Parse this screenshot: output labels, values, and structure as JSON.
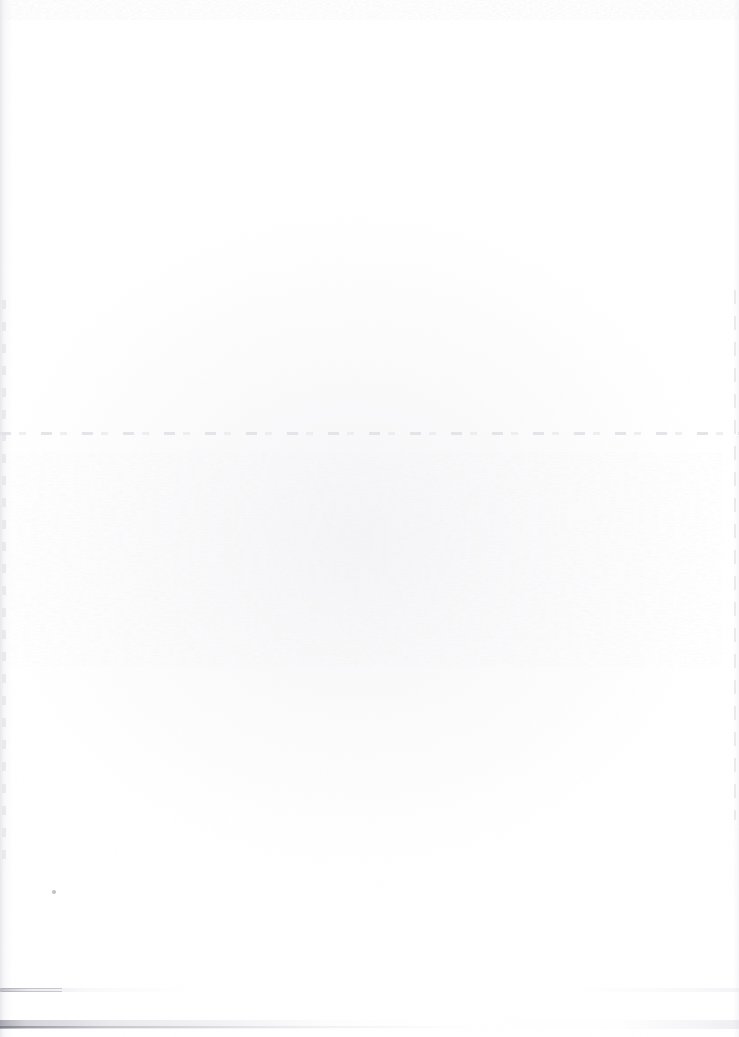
{
  "page": {
    "kind": "scanned-document-page",
    "width_px": 739,
    "height_px": 1037,
    "background_color": "#ffffff",
    "text_content": "",
    "legible_elements_count": 0
  },
  "artifacts": {
    "top_edge_band": {
      "name": "top edge ghost speckle band",
      "region": "y 0-20, full width",
      "color": "#e9e9ee"
    },
    "left_gutter": {
      "name": "left gutter shadow",
      "region": "x 0-12, full height",
      "color": "#e4e4e9"
    },
    "right_edge": {
      "name": "right scanner edge line",
      "region": "x 733-739, y 290-820",
      "color": "#e5e5ea"
    },
    "mid_rule": {
      "name": "faint broken horizontal line",
      "region": "y 432-436, full width",
      "color": "#e2e2e7"
    },
    "bleed_through": {
      "name": "reverse-side bleed-through ghost texture",
      "region": "x 10-722, y 452-667",
      "color": "#ebebf0"
    },
    "dark_speck": {
      "name": "isolated dark speck",
      "region": "x 52-56, y 890-894",
      "color": "#aaaab2"
    },
    "bottom_streak_upper": {
      "name": "upper bottom streak band",
      "region": "y 988-992, full width",
      "color": "#969aa0"
    },
    "bottom_streak_lower": {
      "name": "lower bottom streak band",
      "region": "y 1020-1029, full width",
      "color": "#787884"
    }
  }
}
